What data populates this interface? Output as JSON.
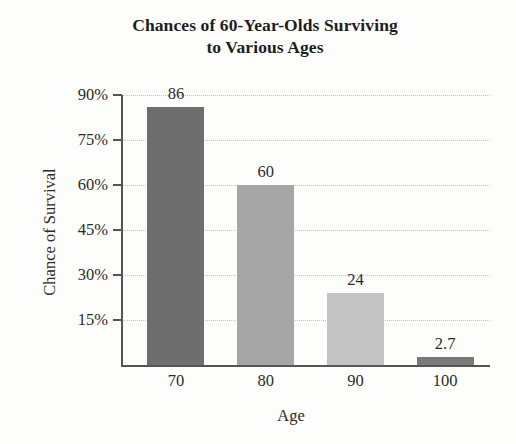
{
  "chart_data": {
    "type": "bar",
    "title": "Chances of 60-Year-Olds Surviving to Various Ages",
    "title_lines": [
      "Chances of 60-Year-Olds Surviving",
      "to Various Ages"
    ],
    "xlabel": "Age",
    "ylabel": "Chance of Survival",
    "categories": [
      "70",
      "80",
      "90",
      "100"
    ],
    "values": [
      86,
      60,
      24,
      2.7
    ],
    "value_labels": [
      "86",
      "60",
      "24",
      "2.7"
    ],
    "bar_colors": [
      "#6e6e6e",
      "#a6a6a6",
      "#c3c3c3",
      "#7a7a7a"
    ],
    "ylim": [
      0,
      90
    ],
    "yticks": [
      15,
      30,
      45,
      60,
      75,
      90
    ],
    "ytick_labels": [
      "15%",
      "30%",
      "45%",
      "60%",
      "75%",
      "90%"
    ],
    "grid": true,
    "grid_axis": "y",
    "legend": false,
    "units": "percent"
  }
}
